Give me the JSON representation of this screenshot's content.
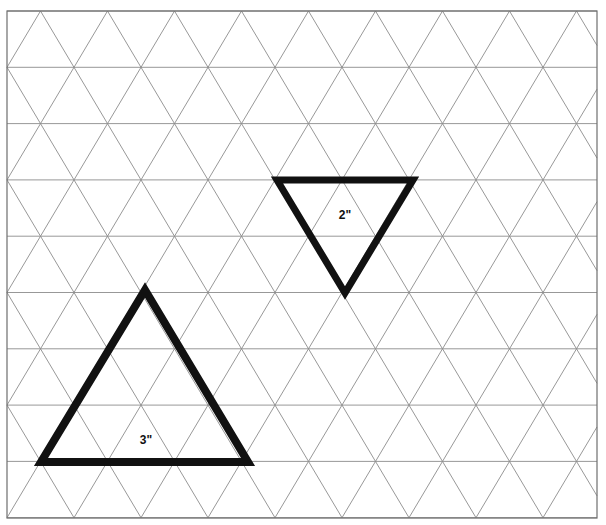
{
  "document": {
    "title": "Triangular Grid Paper Worksheet",
    "kind": "isometric-triangle-grid",
    "width": 606,
    "height": 525,
    "background_color": "#ffffff"
  },
  "grid": {
    "name": "triangular-isometric-grid",
    "line_color": "#8c8c8c",
    "line_width": 0.9,
    "border_color": "#6e6e6e",
    "border_width": 1.2,
    "border": {
      "x": 7,
      "y": 11,
      "width": 590,
      "height": 507
    },
    "origin_x": 7,
    "origin_y": 11,
    "column_spacing": 67,
    "row_spacing": 56.3,
    "row_offset": 33.5,
    "columns": 9,
    "rows": 9,
    "horizontal_rule_count": 9
  },
  "shapes": [
    {
      "name": "small-triangle",
      "orientation": "pointing-down",
      "label": "2\"",
      "side_units": 2,
      "side_length_px": 136,
      "stroke_color": "#111111",
      "stroke_width": 7,
      "vertices": [
        {
          "x": 277,
          "y": 180
        },
        {
          "x": 413,
          "y": 180
        },
        {
          "x": 345,
          "y": 293
        }
      ],
      "label_position": {
        "x": 345,
        "y": 215
      }
    },
    {
      "name": "large-triangle",
      "orientation": "pointing-up",
      "label": "3\"",
      "side_units": 3,
      "side_length_px": 207,
      "stroke_color": "#111111",
      "stroke_width": 8,
      "vertices": [
        {
          "x": 145,
          "y": 290
        },
        {
          "x": 248,
          "y": 462
        },
        {
          "x": 41,
          "y": 462
        }
      ],
      "label_position": {
        "x": 146,
        "y": 440
      }
    }
  ]
}
